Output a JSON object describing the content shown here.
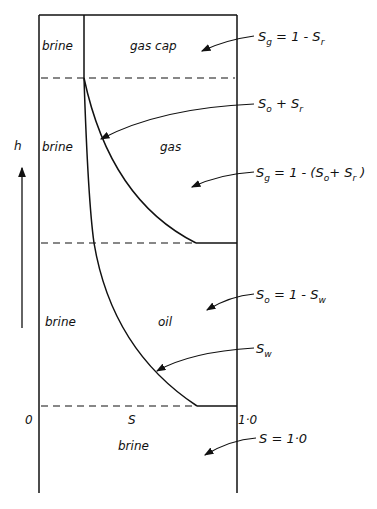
{
  "diagram": {
    "type": "reservoir saturation-height profile",
    "axis": {
      "vertical_label": "h",
      "horizontal_label": "S",
      "x_min_label": "0",
      "x_max_label": "1·0"
    },
    "zones": {
      "gas_cap": "gas cap",
      "gas": "gas",
      "oil": "oil",
      "brine_top": "brine",
      "brine_gas": "brine",
      "brine_oil": "brine",
      "brine_bottom": "brine"
    },
    "annotations": [
      {
        "id": "sg_gascap",
        "S": "S",
        "sub1": "g",
        "rest": " = 1 - S",
        "sub2": "r",
        "tail": ""
      },
      {
        "id": "so_sr",
        "S": "S",
        "sub1": "o",
        "rest": " + S",
        "sub2": "r",
        "tail": ""
      },
      {
        "id": "sg_gaszone",
        "S": "S",
        "sub1": "g",
        "rest": " = 1 - (S",
        "sub2": "o",
        "mid": "+ S",
        "sub3": "r",
        "tail": " )"
      },
      {
        "id": "so_oil",
        "S": "S",
        "sub1": "o",
        "rest": " = 1 - S",
        "sub2": "w",
        "tail": ""
      },
      {
        "id": "sw",
        "S": "S",
        "sub1": "w",
        "rest": "",
        "sub2": "",
        "tail": ""
      },
      {
        "id": "s_one",
        "S": "S",
        "sub1": "",
        "rest": "  = 1·0",
        "sub2": "",
        "tail": ""
      }
    ],
    "colors": {
      "ink": "#111111",
      "background": "#ffffff"
    }
  }
}
